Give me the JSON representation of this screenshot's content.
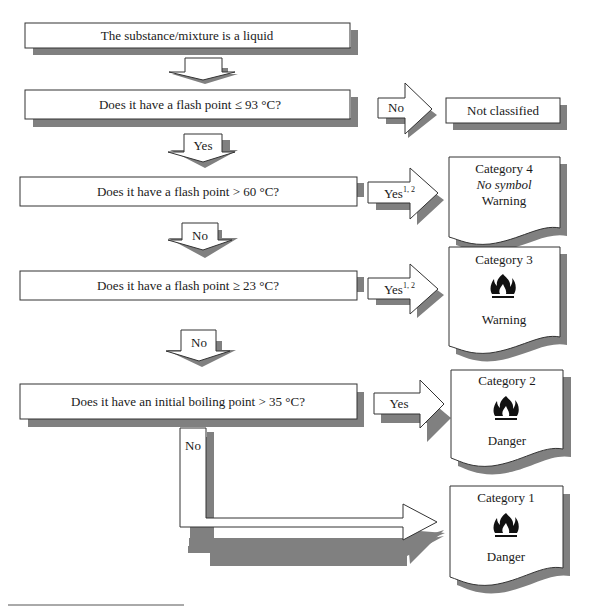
{
  "diagram": {
    "start": "The substance/mixture is a liquid",
    "questions": [
      "Does it have a flash point ≤ 93 °C?",
      "Does it have a flash point > 60 °C?",
      "Does it have a flash point ≥ 23 °C?",
      "Does it have an initial boiling point > 35 °C?"
    ],
    "arrows": {
      "start_down": "",
      "q1_down": "Yes",
      "q1_right": "No",
      "q2_down": "No",
      "q2_right": "Yes",
      "q2_right_sup": "1, 2",
      "q3_down": "No",
      "q3_right": "Yes",
      "q3_right_sup": "1, 2",
      "q4_right": "Yes",
      "q4_down": "No"
    },
    "not_classified": "Not classified",
    "categories": [
      {
        "title": "Category 4",
        "symbol_text": "No symbol",
        "signal": "Warning",
        "icon": "none"
      },
      {
        "title": "Category 3",
        "signal": "Warning",
        "icon": "flame-icon"
      },
      {
        "title": "Category 2",
        "signal": "Danger",
        "icon": "flame-icon"
      },
      {
        "title": "Category 1",
        "signal": "Danger",
        "icon": "flame-icon"
      }
    ]
  }
}
